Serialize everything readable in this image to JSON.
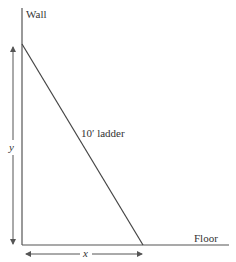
{
  "labels": {
    "wall": "Wall",
    "floor": "Floor",
    "ladder": "10′ ladder",
    "y_var": "y",
    "x_var": "x"
  },
  "geometry": {
    "wall": {
      "x": 22,
      "y_top": 8,
      "y_bottom": 245
    },
    "floor": {
      "y": 245,
      "x_left": 22,
      "x_right": 229
    },
    "ladder": {
      "top": [
        22,
        44
      ],
      "bottom": [
        143,
        245
      ]
    },
    "y_arrow": {
      "x": 13,
      "y_top": 46,
      "y_bottom": 245
    },
    "x_arrow": {
      "y": 254,
      "x_left": 25,
      "x_right": 143
    }
  },
  "colors": {
    "line": "#555555",
    "text": "#333333"
  }
}
